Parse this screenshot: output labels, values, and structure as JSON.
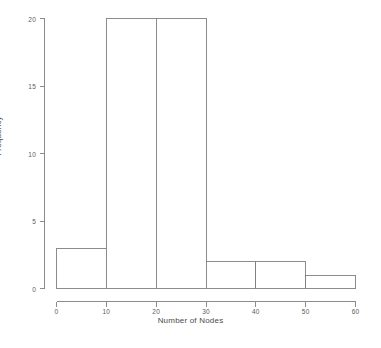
{
  "chart_data": {
    "type": "bar",
    "title": "",
    "subtitle": "",
    "xlabel": "Number of Nodes",
    "ylabel": "Frequency",
    "bin_width": 10,
    "bin_edges": [
      0,
      10,
      20,
      30,
      40,
      50,
      60
    ],
    "categories": [
      "0-10",
      "10-20",
      "20-30",
      "30-40",
      "40-50",
      "50-60"
    ],
    "values": [
      3,
      20,
      20,
      2,
      2,
      1
    ],
    "xlim": [
      0,
      60
    ],
    "ylim": [
      0,
      20
    ],
    "x_ticks": [
      "0",
      "10",
      "20",
      "30",
      "40",
      "50",
      "60"
    ],
    "y_ticks": [
      "0",
      "5",
      "10",
      "15",
      "20"
    ],
    "grid": false,
    "legend": false,
    "legend_position": "none",
    "bar_fill_color": "#ffffff",
    "bar_border_color": "#808080",
    "axis_color": "#808080",
    "text_color": "#4a4a4a",
    "background_color": "#ffffff"
  }
}
